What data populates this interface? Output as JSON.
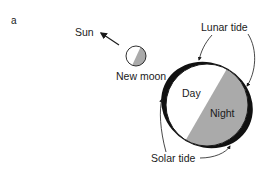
{
  "figure": {
    "panel_label": "a",
    "labels": {
      "sun": "Sun",
      "new_moon": "New moon",
      "lunar_tide": "Lunar tide",
      "solar_tide": "Solar tide",
      "day": "Day",
      "night": "Night"
    },
    "colors": {
      "night_shade": "#aaaaaa",
      "outline": "#1a1a1a",
      "bulge": "#111111",
      "background": "#ffffff"
    }
  }
}
